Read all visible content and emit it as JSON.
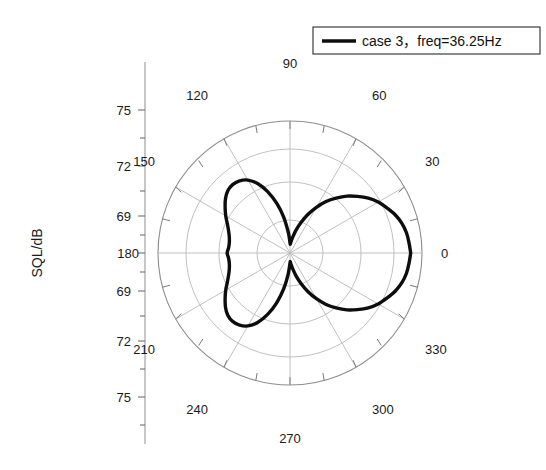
{
  "chart_data": {
    "type": "line",
    "projection": "polar",
    "title": "",
    "subtitle": "",
    "xlabel": "",
    "ylabel": "SQL/dB",
    "grid": true,
    "legend_position": "top-right",
    "legend": [
      "case 3，freq=36.25Hz"
    ],
    "angle_unit": "degrees",
    "angle_ticks": [
      0,
      30,
      60,
      90,
      120,
      150,
      180,
      210,
      240,
      270,
      300,
      330
    ],
    "angle_tick_labels": [
      "0",
      "30",
      "60",
      "90",
      "120",
      "150",
      "180",
      "210",
      "240",
      "270",
      "300",
      "330"
    ],
    "radial_axis": {
      "label": "SQL/dB",
      "tick_labels_upper": [
        "75",
        "72",
        "69"
      ],
      "center_label": "180",
      "tick_labels_lower": [
        "69",
        "72",
        "75"
      ],
      "rmin": 66,
      "rmax": 76.5,
      "ring_values": [
        69,
        72,
        75
      ]
    },
    "series": [
      {
        "name": "case 3，freq=36.25Hz",
        "color": "#0d0d0d",
        "theta": [
          0,
          5,
          10,
          15,
          20,
          25,
          30,
          35,
          40,
          45,
          50,
          55,
          60,
          65,
          70,
          75,
          80,
          85,
          88,
          90,
          92,
          95,
          100,
          105,
          110,
          115,
          120,
          125,
          130,
          135,
          140,
          145,
          150,
          155,
          160,
          165,
          170,
          175,
          180,
          185,
          190,
          195,
          200,
          205,
          210,
          215,
          220,
          225,
          230,
          235,
          240,
          245,
          250,
          255,
          260,
          265,
          270,
          272,
          275,
          280,
          285,
          290,
          295,
          300,
          305,
          310,
          315,
          320,
          325,
          330,
          335,
          340,
          345,
          350,
          355,
          360
        ],
        "r": [
          75.6,
          75.5,
          75.4,
          75.2,
          74.9,
          74.5,
          74.1,
          73.6,
          73.0,
          72.4,
          71.7,
          71.0,
          70.2,
          69.4,
          68.6,
          67.9,
          67.3,
          66.9,
          66.7,
          66.8,
          67.1,
          67.7,
          68.9,
          70.1,
          71.2,
          72.1,
          72.7,
          73.0,
          73.1,
          73.0,
          72.7,
          72.3,
          71.9,
          71.5,
          71.2,
          71.0,
          70.9,
          70.9,
          71.0,
          70.9,
          70.9,
          71.0,
          71.2,
          71.5,
          71.9,
          72.3,
          72.7,
          73.0,
          73.1,
          73.0,
          72.7,
          72.1,
          71.2,
          70.1,
          68.9,
          67.7,
          66.8,
          66.7,
          66.9,
          67.3,
          67.9,
          68.6,
          69.4,
          70.2,
          71.0,
          71.7,
          72.4,
          73.0,
          73.6,
          74.1,
          74.5,
          74.9,
          75.2,
          75.4,
          75.5,
          75.6
        ]
      }
    ],
    "notes": {
      "shape": "Two-lobed acoustic directivity pattern: a large smooth teardrop lobe toward 0 degrees and a kidney-shaped lobe toward 180 degrees, with deep nulls near 90 and 270 degrees."
    }
  },
  "legend": {
    "entry_label": "case 3，freq=36.25Hz"
  },
  "axis": {
    "radial_title": "SQL/dB"
  },
  "radial_labels": {
    "t75_upper": "75",
    "t72_upper": "72",
    "t69_upper": "69",
    "center": "180",
    "t69_lower": "69",
    "t72_lower": "72",
    "t75_lower": "75"
  },
  "angle_labels": {
    "a0": "0",
    "a30": "30",
    "a60": "60",
    "a90": "90",
    "a120": "120",
    "a150": "150",
    "a180": "180",
    "a210": "210",
    "a240": "240",
    "a270": "270",
    "a300": "300",
    "a330": "330"
  },
  "colors": {
    "curve": "#0d0d0d",
    "grid": "#b9b9b9",
    "text": "#1a1a1a",
    "background": "#ffffff"
  }
}
